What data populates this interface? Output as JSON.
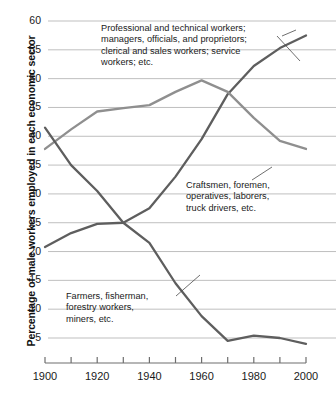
{
  "axes": {
    "y_title": "Percentage of male workers employed in each economic sector",
    "y_ticks": [
      "60",
      "55",
      "50",
      "45",
      "40",
      "35",
      "30",
      "25",
      "20",
      "15",
      "10",
      "5"
    ],
    "x_ticks": [
      "1900",
      "1920",
      "1940",
      "1960",
      "1980",
      "2000"
    ]
  },
  "annotations": {
    "professional": "Professional and technical workers;\nmanagers, officials, and proprietors;\nclerical and sales workers; service\nworkers; etc.",
    "craftsmen": "Craftsmen, foremen,\noperatives, laborers,\ntruck drivers, etc.",
    "farmers": "Farmers, fisherman,\nforestry workers,\nminers, etc."
  },
  "colors": {
    "series_professional": "#5e5e5e",
    "series_craftsmen": "#8f8f8f",
    "series_farmers": "#5e5e5e",
    "gridline": "#b8b8b8",
    "axis": "#6e6e6e",
    "text": "#1a1a1a"
  },
  "chart_data": {
    "type": "line",
    "title": "",
    "xlabel": "",
    "ylabel": "Percentage of male workers employed in each economic sector",
    "xlim": [
      1900,
      2000
    ],
    "ylim": [
      0,
      60
    ],
    "yticks": [
      5,
      10,
      15,
      20,
      25,
      30,
      35,
      40,
      45,
      50,
      55,
      60
    ],
    "xticks": [
      1900,
      1910,
      1920,
      1930,
      1940,
      1950,
      1960,
      1970,
      1980,
      1990,
      2000
    ],
    "xtick_labels_shown": [
      1900,
      1920,
      1940,
      1960,
      1980,
      2000
    ],
    "grid": "horizontal",
    "legend": "annotations-inline",
    "x": [
      1900,
      1910,
      1920,
      1930,
      1940,
      1950,
      1960,
      1970,
      1980,
      1990,
      2000
    ],
    "series": [
      {
        "name": "Professional and technical workers; managers, officials, and proprietors; clerical and sales workers; service workers; etc.",
        "color": "#5e5e5e",
        "values": [
          20.8,
          23.2,
          24.8,
          25.0,
          27.5,
          33.0,
          39.5,
          47.3,
          52.2,
          55.3,
          57.5
        ]
      },
      {
        "name": "Craftsmen, foremen, operatives, laborers, truck drivers, etc.",
        "color": "#8f8f8f",
        "values": [
          37.8,
          41.2,
          44.3,
          44.9,
          45.4,
          47.7,
          49.7,
          47.7,
          43.2,
          39.2,
          37.8
        ]
      },
      {
        "name": "Farmers, fisherman, forestry workers, miners, etc.",
        "color": "#5e5e5e",
        "values": [
          41.5,
          35.0,
          30.5,
          25.0,
          21.5,
          14.5,
          8.8,
          4.5,
          5.4,
          5.0,
          4.0
        ]
      }
    ]
  }
}
